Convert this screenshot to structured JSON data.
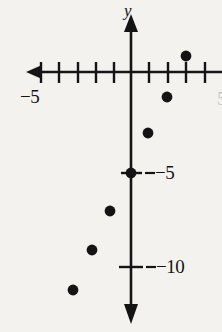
{
  "figure": {
    "name": "coordinate-plane-scatter-plot",
    "background_color": "#f4f2ef",
    "ink_color": "#141414"
  },
  "axes": {
    "y_axis_name": "y",
    "x_axis_label": "−5",
    "x_axis_label_value": -5,
    "y_tick_labels": [
      {
        "text": "−5",
        "value": -5
      },
      {
        "text": "−10",
        "value": -10
      }
    ],
    "right_edge_partial_label": "5",
    "x_tick_count_left": 5,
    "x_tick_count_right": 4,
    "arrows": [
      "left",
      "up",
      "down"
    ]
  },
  "chart_data": {
    "type": "scatter",
    "title": "",
    "xlabel": "",
    "ylabel": "y",
    "xlim": [
      -6,
      4
    ],
    "ylim": [
      -13,
      2
    ],
    "grid": false,
    "legend": null,
    "x": [
      -3,
      -2,
      -1,
      0,
      1,
      2,
      3
    ],
    "y": [
      -11.5,
      -9.5,
      -7.5,
      -5,
      -3.2,
      -1.3,
      0.9
    ],
    "points": [
      {
        "x": -3,
        "y": -11.5,
        "px": 73,
        "py": 290
      },
      {
        "x": -2,
        "y": -9.5,
        "px": 92,
        "py": 250
      },
      {
        "x": -1,
        "y": -7.5,
        "px": 110,
        "py": 211
      },
      {
        "x": 0,
        "y": -5,
        "px": 131,
        "py": 173
      },
      {
        "x": 1,
        "y": -3.2,
        "px": 148,
        "py": 133
      },
      {
        "x": 2,
        "y": -1.3,
        "px": 167,
        "py": 97
      },
      {
        "x": 3,
        "y": 0.9,
        "px": 186,
        "py": 56
      }
    ],
    "axis_origin_px": {
      "x": 131,
      "y": 72
    },
    "unit_px": {
      "x": 18.7,
      "y": 18.8
    }
  }
}
